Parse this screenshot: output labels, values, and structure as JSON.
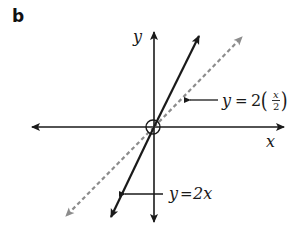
{
  "panel": {
    "label": "b"
  },
  "axes": {
    "x_label": "x",
    "y_label": "y"
  },
  "lines": [
    {
      "name": "y=2x",
      "style": "solid",
      "color": "#1a1a1a",
      "label_lhs": "y",
      "label_eq": "=",
      "label_rhs": "2x"
    },
    {
      "name": "y=2(x/2)",
      "style": "dashed",
      "color": "#8c8c8c",
      "label_lhs": "y",
      "label_eq": "=",
      "label_coef": "2",
      "label_num": "x",
      "label_den": "2"
    }
  ],
  "origin_marker": "open-circle",
  "colors": {
    "axis": "#1a1a1a",
    "solid_line": "#1a1a1a",
    "dashed_line": "#8c8c8c"
  }
}
